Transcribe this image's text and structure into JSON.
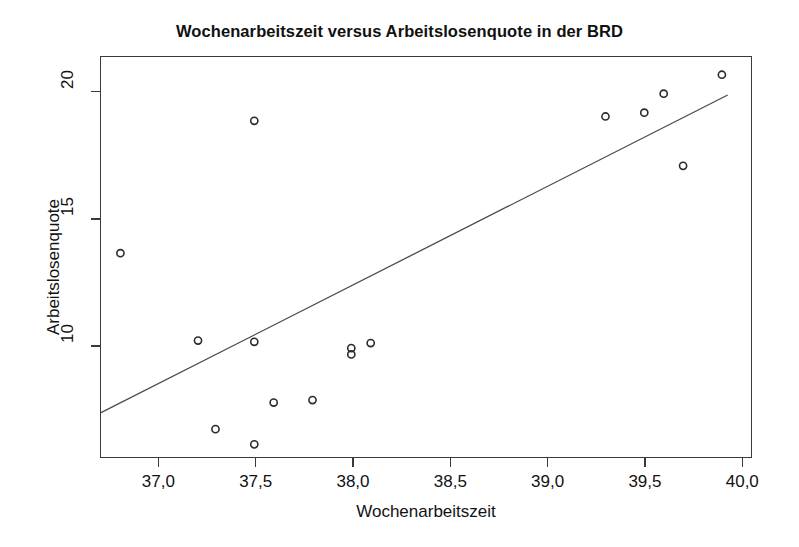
{
  "chart_data": {
    "type": "scatter",
    "title": "Wochenarbeitszeit versus Arbeitslosenquote in der BRD",
    "xlabel": "Wochenarbeitszeit",
    "ylabel": "Arbeitslosenquote",
    "xlim": [
      36.7,
      40.05
    ],
    "ylim": [
      5.6,
      21.4
    ],
    "xticks": [
      37.0,
      37.5,
      38.0,
      38.5,
      39.0,
      39.5,
      40.0
    ],
    "xticklabels": [
      "37,0",
      "37,5",
      "38,0",
      "38,5",
      "39,0",
      "39,5",
      "40,0"
    ],
    "yticks": [
      10,
      15,
      20
    ],
    "yticklabels": [
      "10",
      "15",
      "20"
    ],
    "grid": false,
    "legend": null,
    "marker": "open-circle",
    "marker_color": "#2b2b2b",
    "line_color": "#4a4a4a",
    "points": [
      {
        "x": 36.8,
        "y": 13.65
      },
      {
        "x": 37.2,
        "y": 10.2
      },
      {
        "x": 37.29,
        "y": 6.7
      },
      {
        "x": 37.49,
        "y": 18.88
      },
      {
        "x": 37.49,
        "y": 10.15
      },
      {
        "x": 37.49,
        "y": 6.1
      },
      {
        "x": 37.59,
        "y": 7.75
      },
      {
        "x": 37.79,
        "y": 7.85
      },
      {
        "x": 37.99,
        "y": 9.9
      },
      {
        "x": 37.99,
        "y": 9.65
      },
      {
        "x": 38.09,
        "y": 10.1
      },
      {
        "x": 39.3,
        "y": 19.05
      },
      {
        "x": 39.5,
        "y": 19.2
      },
      {
        "x": 39.6,
        "y": 19.95
      },
      {
        "x": 39.7,
        "y": 17.1
      },
      {
        "x": 39.9,
        "y": 20.7
      }
    ],
    "fit_line": {
      "name": "Regressionsgerade",
      "x0": 36.7,
      "y0": 7.35,
      "x1": 39.93,
      "y1": 19.9
    }
  }
}
